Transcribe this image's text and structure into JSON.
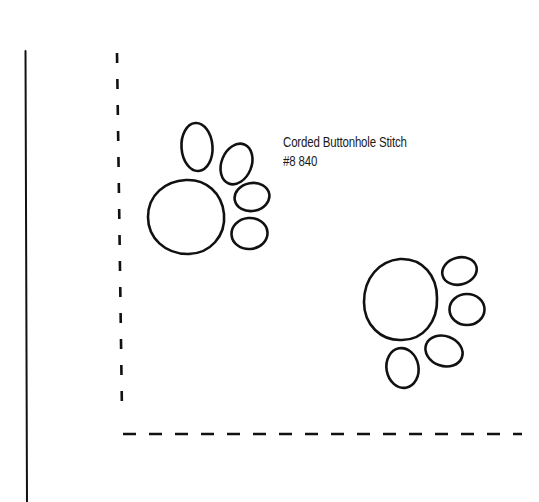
{
  "diagram": {
    "type": "embroidery-pattern",
    "stroke_color": "#111111",
    "background": "#ffffff",
    "annotation": {
      "stitch_name": "Corded Buttonhole Stitch",
      "thread": "#8 840"
    },
    "elements": {
      "border_line": "solid vertical line (left edge)",
      "corner_guide": "dashed L-shaped corner guide",
      "paw_prints": [
        {
          "name": "paw-print-upper-left",
          "toes": 4
        },
        {
          "name": "paw-print-lower-right",
          "toes": 4
        }
      ]
    }
  }
}
